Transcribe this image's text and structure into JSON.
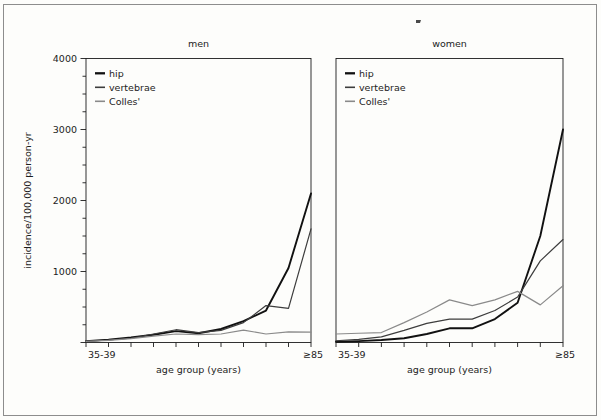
{
  "figure": {
    "background_color": "#fdfdfb",
    "frame_color": "#8d8d8d",
    "axis_color": "#1c1c1c",
    "artifact_mark": "speck"
  },
  "axis": {
    "y_title": "incidence/100,000 person-yr",
    "x_title": "age group (years)",
    "y_ticks_major": [
      "0",
      "1000",
      "2000",
      "3000",
      "4000"
    ],
    "y_major_values": [
      0,
      1000,
      2000,
      3000,
      4000
    ],
    "y_minor_step": 250,
    "y_label_shown": [
      "1000",
      "2000",
      "3000",
      "4000"
    ],
    "x_first_label": "35-39",
    "x_last_label": "≥85"
  },
  "legend": {
    "entries": [
      {
        "label": "hip",
        "color": "#111111",
        "width": 1.9
      },
      {
        "label": "vertebrae",
        "color": "#3d3d3d",
        "width": 1.2
      },
      {
        "label": "Colles'",
        "color": "#8a8a8a",
        "width": 1.2
      }
    ]
  },
  "chart_data": {
    "type": "line",
    "title": "",
    "xlabel": "age group (years)",
    "ylabel": "incidence/100,000 person-yr",
    "ylim": [
      0,
      4000
    ],
    "grid": false,
    "legend_position": "top-left",
    "categories": [
      "35-39",
      "40-44",
      "45-49",
      "50-54",
      "55-59",
      "60-64",
      "65-69",
      "70-74",
      "75-79",
      "80-84",
      "≥85"
    ],
    "panels": [
      {
        "name": "men",
        "title": "men",
        "series": [
          {
            "name": "hip",
            "color": "#111111",
            "values": [
              20,
              40,
              70,
              110,
              160,
              130,
              190,
              300,
              450,
              1050,
              2100
            ]
          },
          {
            "name": "vertebrae",
            "color": "#3d3d3d",
            "values": [
              15,
              35,
              60,
              120,
              180,
              140,
              170,
              280,
              520,
              480,
              1600
            ]
          },
          {
            "name": "Colles'",
            "color": "#8a8a8a",
            "values": [
              15,
              30,
              55,
              90,
              120,
              110,
              120,
              175,
              120,
              150,
              145
            ]
          }
        ]
      },
      {
        "name": "women",
        "title": "women",
        "series": [
          {
            "name": "hip",
            "color": "#111111",
            "values": [
              10,
              20,
              35,
              60,
              120,
              200,
              200,
              330,
              560,
              1500,
              3000
            ]
          },
          {
            "name": "vertebrae",
            "color": "#3d3d3d",
            "values": [
              25,
              45,
              80,
              170,
              270,
              330,
              330,
              450,
              640,
              1150,
              1450
            ]
          },
          {
            "name": "Colles'",
            "color": "#8a8a8a",
            "values": [
              120,
              130,
              140,
              280,
              430,
              600,
              520,
              600,
              720,
              530,
              800
            ]
          }
        ]
      }
    ]
  }
}
